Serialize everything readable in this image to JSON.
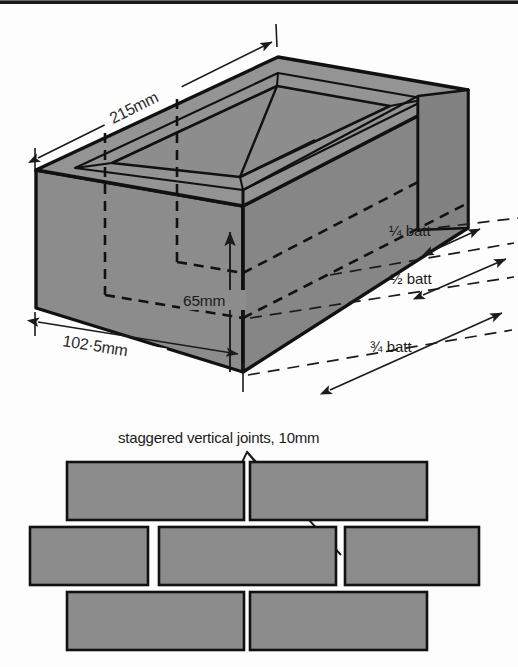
{
  "figure": {
    "top_rule": true,
    "colors": {
      "brick_fill": "#8c8c8c",
      "brick_fill_dark": "#7f7f7f",
      "brick_fill_light": "#949494",
      "outline": "#111111",
      "background": "#fdfdfd",
      "text": "#1b1b1b"
    }
  },
  "isometric_brick": {
    "dimensions": [
      {
        "id": "length",
        "label": "215mm",
        "value": 215,
        "unit": "mm",
        "edge": "top-rear-left"
      },
      {
        "id": "width",
        "label": "102·5mm",
        "value": 102.5,
        "unit": "mm",
        "edge": "bottom-front-left"
      },
      {
        "id": "height",
        "label": "65mm",
        "value": 65,
        "unit": "mm",
        "edge": "front-vertical"
      }
    ],
    "batt_labels": [
      {
        "id": "quarter-batt",
        "label": "¼ batt",
        "fraction": "1/4"
      },
      {
        "id": "half-batt",
        "label": "½ batt",
        "fraction": "1/2"
      },
      {
        "id": "three-quarter-batt",
        "label": "¾ batt",
        "fraction": "3/4"
      }
    ],
    "frog_note": "recessed frog on upper bed face"
  },
  "bond_wall": {
    "caption": "staggered vertical joints, 10mm",
    "joint_size": "10mm",
    "rows": [
      {
        "id": "row-top",
        "bricks": [
          {
            "id": "brick-r1-c1",
            "kind": "full"
          },
          {
            "id": "brick-r1-c2",
            "kind": "full"
          }
        ]
      },
      {
        "id": "row-middle",
        "bricks": [
          {
            "id": "brick-r2-c1",
            "kind": "part"
          },
          {
            "id": "brick-r2-c2",
            "kind": "full"
          },
          {
            "id": "brick-r2-c3",
            "kind": "part"
          }
        ]
      },
      {
        "id": "row-bottom",
        "bricks": [
          {
            "id": "brick-r3-c1",
            "kind": "full"
          },
          {
            "id": "brick-r3-c2",
            "kind": "full"
          }
        ]
      }
    ]
  }
}
